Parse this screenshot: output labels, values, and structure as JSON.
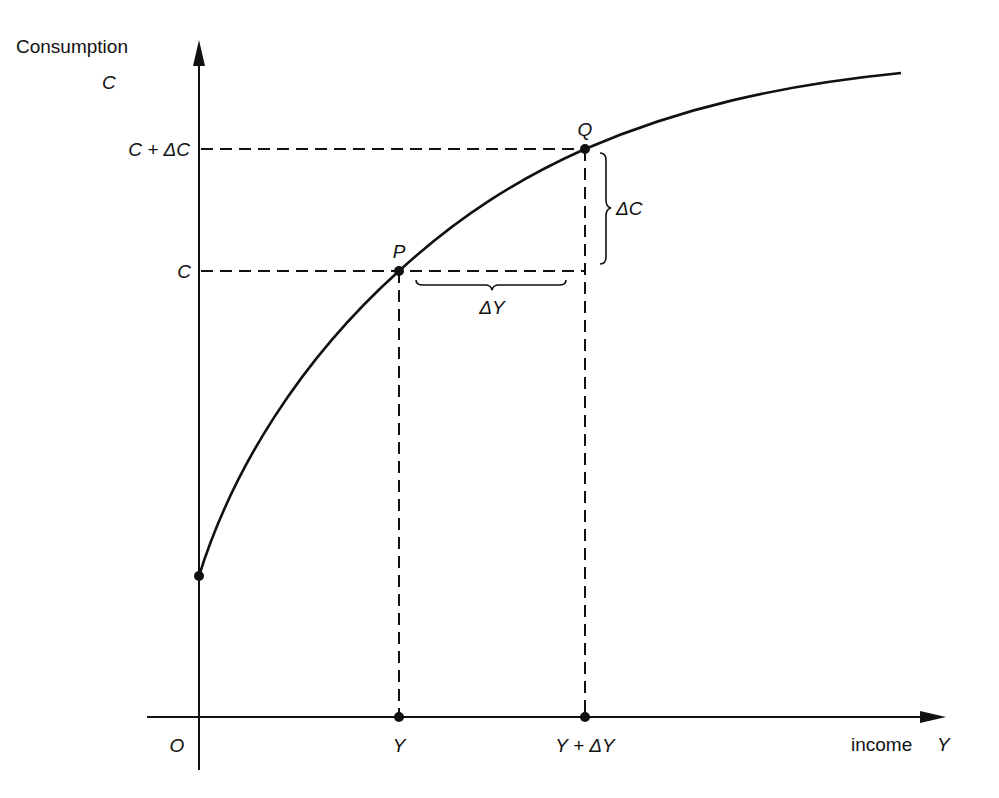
{
  "diagram": {
    "colors": {
      "ink": "#111111",
      "background": "#ffffff"
    },
    "y_axis": {
      "label": "Consumption",
      "symbol": "C"
    },
    "x_axis": {
      "label": "income",
      "symbol": "Y"
    },
    "origin_label": "O",
    "y_ticks": [
      {
        "label": "C + ΔC",
        "level": "Q"
      },
      {
        "label": "C",
        "level": "P"
      }
    ],
    "x_ticks": [
      {
        "label": "Y",
        "at": "P"
      },
      {
        "label": "Y + ΔY",
        "at": "Q"
      }
    ],
    "points": [
      {
        "name": "P",
        "label": "P"
      },
      {
        "name": "Q",
        "label": "Q"
      }
    ],
    "braces": [
      {
        "name": "delta-c",
        "label": "ΔC",
        "orientation": "vertical"
      },
      {
        "name": "delta-y",
        "label": "ΔY",
        "orientation": "horizontal"
      }
    ],
    "curve": {
      "shape": "concave increasing",
      "starts_at": "positive C-intercept"
    }
  }
}
